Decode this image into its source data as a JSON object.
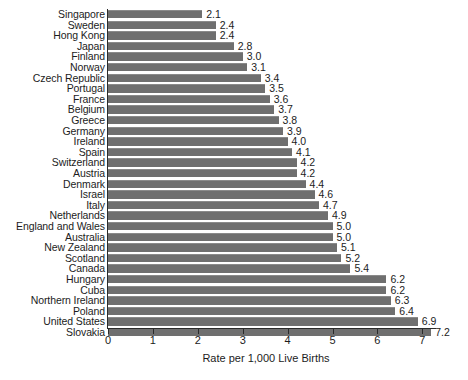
{
  "chart_data": {
    "type": "bar",
    "orientation": "horizontal",
    "title": "",
    "xlabel": "Rate per 1,000 Live Births",
    "ylabel": "",
    "xlim": [
      0,
      7.3
    ],
    "xticks": [
      0,
      1,
      2,
      3,
      4,
      5,
      6,
      7
    ],
    "xtick_labels": [
      "0",
      "1",
      "2",
      "3",
      "4",
      "5",
      "6",
      "7"
    ],
    "grid": false,
    "legend": null,
    "bar_color": "#6f6f6f",
    "value_label_format": "one-decimal",
    "categories": [
      "Singapore",
      "Sweden",
      "Hong Kong",
      "Japan",
      "Finland",
      "Norway",
      "Czech Republic",
      "Portugal",
      "France",
      "Belgium",
      "Greece",
      "Germany",
      "Ireland",
      "Spain",
      "Switzerland",
      "Austria",
      "Denmark",
      "Israel",
      "Italy",
      "Netherlands",
      "England and Wales",
      "Australia",
      "New Zealand",
      "Scotland",
      "Canada",
      "Hungary",
      "Cuba",
      "Northern Ireland",
      "Poland",
      "United States",
      "Slovakia"
    ],
    "values": [
      2.1,
      2.4,
      2.4,
      2.8,
      3.0,
      3.1,
      3.4,
      3.5,
      3.6,
      3.7,
      3.8,
      3.9,
      4.0,
      4.1,
      4.2,
      4.2,
      4.4,
      4.6,
      4.7,
      4.9,
      5.0,
      5.0,
      5.1,
      5.2,
      5.4,
      6.2,
      6.2,
      6.3,
      6.4,
      6.9,
      7.2
    ],
    "value_labels": [
      "2.1",
      "2.4",
      "2.4",
      "2.8",
      "3.0",
      "3.1",
      "3.4",
      "3.5",
      "3.6",
      "3.7",
      "3.8",
      "3.9",
      "4.0",
      "4.1",
      "4.2",
      "4.2",
      "4.4",
      "4.6",
      "4.7",
      "4.9",
      "5.0",
      "5.0",
      "5.1",
      "5.2",
      "5.4",
      "6.2",
      "6.2",
      "6.3",
      "6.4",
      "6.9",
      "7.2"
    ]
  }
}
